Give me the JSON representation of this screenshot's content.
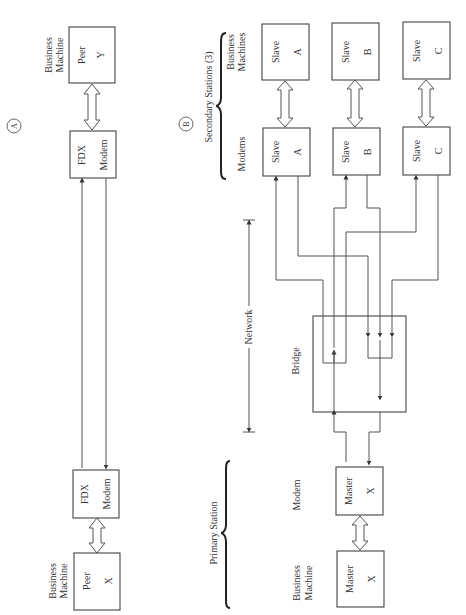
{
  "panels": {
    "a": {
      "marker": "A",
      "peer_y": {
        "role": "Peer",
        "id": "Y",
        "label_line1": "Business",
        "label_line2": "Machine"
      },
      "modem_top": {
        "type": "FDX",
        "name": "Modem"
      },
      "modem_bottom": {
        "type": "FDX",
        "name": "Modem"
      },
      "peer_x": {
        "role": "Peer",
        "id": "X",
        "label_line1": "Business",
        "label_line2": "Machine"
      }
    },
    "b": {
      "marker": "B",
      "secondary_group_label": "Secondary Stations (3)",
      "business_machines_label_line1": "Business",
      "business_machines_label_line2": "Machines",
      "modems_label": "Modems",
      "network_label": "Network",
      "bridge_label": "Bridge",
      "primary_group_label": "Primary Station",
      "primary_modem_label": "Modem",
      "primary_bm_label_line1": "Business",
      "primary_bm_label_line2": "Machine",
      "slaves": [
        {
          "role": "Slave",
          "id": "A"
        },
        {
          "role": "Slave",
          "id": "B"
        },
        {
          "role": "Slave",
          "id": "C"
        }
      ],
      "slave_modems": [
        {
          "role": "Slave",
          "id": "A"
        },
        {
          "role": "Slave",
          "id": "B"
        },
        {
          "role": "Slave",
          "id": "C"
        }
      ],
      "master_modem": {
        "role": "Master",
        "id": "X"
      },
      "master_bm": {
        "role": "Master",
        "id": "X"
      }
    }
  }
}
